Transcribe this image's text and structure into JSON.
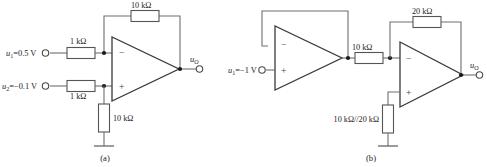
{
  "figure": {
    "caption_a": "(a)",
    "caption_b": "(b)"
  },
  "circuit_a": {
    "name": "difference-amplifier",
    "sources": [
      {
        "id": "u1",
        "label_var": "u",
        "label_sub": "1",
        "label_value": "=0.5 V"
      },
      {
        "id": "u2",
        "label_var": "u",
        "label_sub": "2",
        "label_value": "=−0.1 V"
      }
    ],
    "resistors": [
      {
        "id": "r-in-1",
        "label": "1 kΩ"
      },
      {
        "id": "r-in-2",
        "label": "1 kΩ"
      },
      {
        "id": "r-feedback",
        "label": "10 kΩ"
      },
      {
        "id": "r-ground",
        "label": "10 kΩ"
      }
    ],
    "opamp": {
      "inverting_pin": "−",
      "noninverting_pin": "+"
    },
    "output": {
      "label_var": "u",
      "label_sub": "O"
    }
  },
  "circuit_b": {
    "name": "buffer-inverting-amplifier",
    "sources": [
      {
        "id": "u1",
        "label_var": "u",
        "label_sub": "1",
        "label_value": "=−1 V"
      }
    ],
    "resistors": [
      {
        "id": "r-series",
        "label": "10 kΩ"
      },
      {
        "id": "r-feedback",
        "label": "20 kΩ"
      },
      {
        "id": "r-balance",
        "label": "10 kΩ//20 kΩ"
      }
    ],
    "opamp1": {
      "inverting_pin": "−",
      "noninverting_pin": "+"
    },
    "opamp2": {
      "inverting_pin": "−",
      "noninverting_pin": "+"
    },
    "output": {
      "label_var": "u",
      "label_sub": "O"
    }
  },
  "colors": {
    "wire": "#6f6f6f",
    "device": "#3a3a3a",
    "node": "#1a1a1a",
    "text": "#1c1c1c",
    "background": "#ffffff"
  }
}
